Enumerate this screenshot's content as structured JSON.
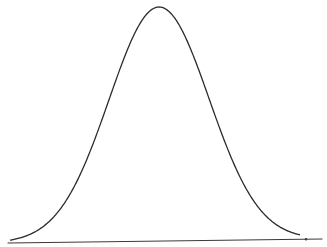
{
  "diagram": {
    "type": "normal-distribution-curve",
    "colors": {
      "background": "#ffffff",
      "curve": "#2a2a2a",
      "baseline": "#3a3a3a"
    },
    "curve": {
      "peak_x": 159,
      "peak_y": 7,
      "sigma_px": 50,
      "x_start": 10,
      "x_end": 300,
      "stroke_width": 1.3
    },
    "baseline": {
      "x1": 8,
      "y1": 243,
      "x2": 322,
      "y2": 239,
      "stroke_width": 1.2
    },
    "marker": {
      "x": 306,
      "y": 239.3,
      "r": 1.2
    }
  }
}
